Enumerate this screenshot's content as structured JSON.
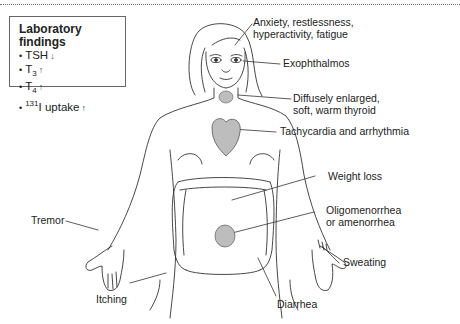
{
  "lab_findings": {
    "title": "Laboratory findings",
    "items": [
      {
        "name": "TSH",
        "sub": "",
        "sup": "",
        "direction_icon": "down-arrow",
        "arrow": "↓"
      },
      {
        "name": "T",
        "sub": "3",
        "sup": "",
        "direction_icon": "up-arrow",
        "arrow": "↑"
      },
      {
        "name": "T",
        "sub": "4",
        "sup": "",
        "direction_icon": "up-arrow",
        "arrow": "↑"
      },
      {
        "name": "I uptake",
        "sub": "",
        "sup": "131",
        "direction_icon": "up-arrow",
        "arrow": "↑"
      }
    ],
    "bullet": "•"
  },
  "symptoms": {
    "anxiety_line1": "Anxiety, restlessness,",
    "anxiety_line2": "hyperactivity, fatigue",
    "exophthalmos": "Exophthalmos",
    "thyroid_line1": "Diffusely enlarged,",
    "thyroid_line2": "soft, warm thyroid",
    "tachycardia": "Tachycardia and arrhythmia",
    "weight_loss": "Weight loss",
    "oligo_line1": "Oligomenorrhea",
    "oligo_line2": "or amenorrhea",
    "sweating": "Sweating",
    "tremor": "Tremor",
    "itching": "Itching",
    "diarrhea": "Diarrhea"
  },
  "colors": {
    "line": "#333333",
    "organ_fill": "#bdbdbd",
    "border": "#777777"
  }
}
